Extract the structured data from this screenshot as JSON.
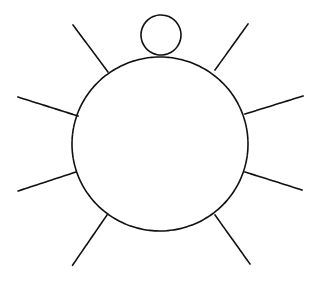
{
  "diagram": {
    "colors": {
      "background": "#ffffff",
      "stroke": "#111111"
    },
    "body_circle": {
      "cx": 160,
      "cy": 144,
      "rx": 88,
      "ry": 87
    },
    "head_circle": {
      "cx": 161,
      "cy": 35,
      "r": 20
    },
    "rays": [
      {
        "name": "ray-top-left",
        "x1": 108,
        "y1": 72,
        "x2": 73,
        "y2": 25
      },
      {
        "name": "ray-top-right",
        "x1": 215,
        "y1": 70,
        "x2": 248,
        "y2": 24
      },
      {
        "name": "ray-left-upper",
        "x1": 78,
        "y1": 116,
        "x2": 18,
        "y2": 97
      },
      {
        "name": "ray-right-upper",
        "x1": 245,
        "y1": 114,
        "x2": 303,
        "y2": 96
      },
      {
        "name": "ray-left-lower",
        "x1": 76,
        "y1": 172,
        "x2": 18,
        "y2": 191
      },
      {
        "name": "ray-right-lower",
        "x1": 245,
        "y1": 172,
        "x2": 302,
        "y2": 190
      },
      {
        "name": "ray-bottom-left",
        "x1": 107,
        "y1": 215,
        "x2": 72,
        "y2": 266
      },
      {
        "name": "ray-bottom-right",
        "x1": 215,
        "y1": 215,
        "x2": 250,
        "y2": 264
      }
    ]
  }
}
